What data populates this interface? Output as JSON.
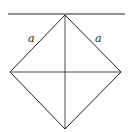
{
  "diagram": {
    "type": "geometry",
    "labels": {
      "left_edge": "a",
      "right_edge": "a"
    },
    "stroke_color": "#222222"
  }
}
